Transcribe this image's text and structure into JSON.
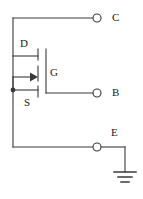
{
  "figure": {
    "kind": "circuit-schematic",
    "title": "",
    "background_color": "#ffffff",
    "line_color": "#3a3a3a",
    "text_color": "#1a1a1a",
    "width": 143,
    "height": 199
  },
  "terminals": [
    {
      "id": "c",
      "label": "C",
      "x": 97,
      "y": 18,
      "marker": "open-circle",
      "radius": 4
    },
    {
      "id": "b",
      "label": "B",
      "x": 97,
      "y": 93,
      "marker": "open-circle",
      "radius": 4
    },
    {
      "id": "e",
      "label": "E",
      "x": 97,
      "y": 147,
      "marker": "open-circle",
      "radius": 4
    }
  ],
  "device": {
    "type": "mosfet-n-channel",
    "pin_labels": {
      "drain": "D",
      "gate": "G",
      "source": "S"
    },
    "arrow_direction": "into-channel",
    "body_junction_dot": {
      "x": 13,
      "y": 90
    }
  },
  "ground": {
    "symbol": "earth-ground",
    "x": 125,
    "y": 177,
    "bars": 3
  },
  "labels": {
    "c": "C",
    "b": "B",
    "e": "E",
    "d": "D",
    "g": "G",
    "s": "S"
  }
}
